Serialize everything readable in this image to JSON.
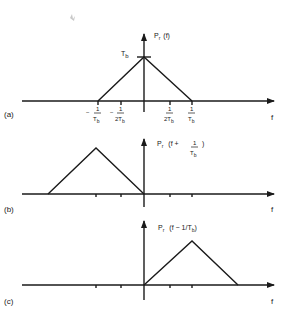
{
  "diagram": {
    "panels": [
      {
        "id": "a",
        "label": "(a)",
        "function_label": "P",
        "function_sub": "r",
        "function_arg": "(f)",
        "peak_label": "T",
        "peak_sub": "b",
        "axis_label": "f",
        "ticks": [
          {
            "num": "1",
            "den": "T",
            "den_sub": "b",
            "sign": "−"
          },
          {
            "num": "1",
            "den": "2T",
            "den_sub": "b",
            "sign": "−"
          },
          {
            "num": "1",
            "den": "2T",
            "den_sub": "b",
            "sign": ""
          },
          {
            "num": "1",
            "den": "T",
            "den_sub": "b",
            "sign": ""
          }
        ]
      },
      {
        "id": "b",
        "label": "(b)",
        "function_label": "P",
        "function_sub": "r",
        "function_arg_pre": "(f +",
        "function_arg_num": "1",
        "function_arg_den": "T",
        "function_arg_den_sub": "b",
        "function_arg_post": ")",
        "axis_label": "f"
      },
      {
        "id": "c",
        "label": "(c)",
        "function_label": "P",
        "function_sub": "r",
        "function_arg_pre": "(f − 1/T",
        "function_arg_sub": "b",
        "function_arg_post": ")",
        "axis_label": "f"
      }
    ],
    "colors": {
      "ink": "#1a1a1a",
      "background": "#ffffff",
      "smudge": "#c8c8c8"
    }
  }
}
